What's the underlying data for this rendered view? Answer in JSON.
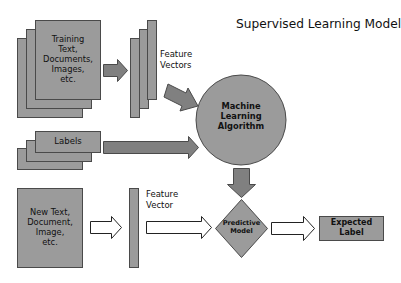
{
  "title": "Supervised Learning Model",
  "colors": {
    "box_fill": "#9b9b9b",
    "arrow_fill": "#808080",
    "outline": "#4a4a4a",
    "hollow_arrow_fill": "#ffffff",
    "background": "#ffffff"
  },
  "nodes": {
    "training_docs": {
      "lines": [
        "Training",
        "Text,",
        "Documents,",
        "Images,",
        "etc."
      ]
    },
    "feature_vectors": {
      "label_lines": [
        "Feature",
        "Vectors"
      ]
    },
    "labels": {
      "label": "Labels"
    },
    "ml_algorithm": {
      "lines": [
        "Machine",
        "Learning",
        "Algorithm"
      ]
    },
    "new_input": {
      "lines": [
        "New Text,",
        "Document,",
        "Image,",
        "etc."
      ]
    },
    "feature_vector": {
      "label_lines": [
        "Feature",
        "Vector"
      ]
    },
    "predictive_model": {
      "lines": [
        "Predictive",
        "Model"
      ]
    },
    "expected_label": {
      "lines": [
        "Expected",
        "Label"
      ]
    }
  },
  "edges": [
    {
      "from": "training_docs",
      "to": "feature_vectors",
      "style": "filled"
    },
    {
      "from": "feature_vectors",
      "to": "ml_algorithm",
      "style": "filled"
    },
    {
      "from": "labels",
      "to": "ml_algorithm",
      "style": "filled"
    },
    {
      "from": "ml_algorithm",
      "to": "predictive_model",
      "style": "filled"
    },
    {
      "from": "new_input",
      "to": "feature_vector",
      "style": "hollow"
    },
    {
      "from": "feature_vector",
      "to": "predictive_model",
      "style": "hollow"
    },
    {
      "from": "predictive_model",
      "to": "expected_label",
      "style": "hollow"
    }
  ]
}
